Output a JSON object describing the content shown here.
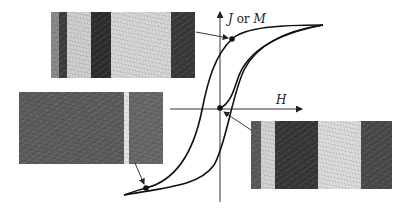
{
  "figure": {
    "axes": {
      "y_label_var1": "J",
      "y_label_or": "or",
      "y_label_var2": "M",
      "x_label": "H"
    },
    "colors": {
      "curve": "#111111",
      "axis": "#333333",
      "dark_domain": "#3a3a3a",
      "light_domain": "#d9d9d9"
    },
    "images": [
      {
        "id": "top-left-domains",
        "stripes": [
          {
            "x": 0,
            "w": 8,
            "shade": "#8a8a8a"
          },
          {
            "x": 8,
            "w": 8,
            "shade": "#3e3e3e"
          },
          {
            "x": 16,
            "w": 24,
            "shade": "#cfcfcf"
          },
          {
            "x": 40,
            "w": 20,
            "shade": "#2e2e2e"
          },
          {
            "x": 60,
            "w": 60,
            "shade": "#d6d6d6"
          },
          {
            "x": 120,
            "w": 24,
            "shade": "#3a3a3a"
          }
        ]
      },
      {
        "id": "left-domains",
        "stripes": [
          {
            "x": 0,
            "w": 105,
            "shade": "#5c5c5c"
          },
          {
            "x": 105,
            "w": 5,
            "shade": "#e6e6e6"
          },
          {
            "x": 110,
            "w": 34,
            "shade": "#686868"
          }
        ]
      },
      {
        "id": "right-domains",
        "stripes": [
          {
            "x": 0,
            "w": 10,
            "shade": "#5a5a5a"
          },
          {
            "x": 10,
            "w": 14,
            "shade": "#d3d3d3"
          },
          {
            "x": 24,
            "w": 43,
            "shade": "#383838"
          },
          {
            "x": 67,
            "w": 43,
            "shade": "#dcdcdc"
          },
          {
            "x": 110,
            "w": 31,
            "shade": "#4a4a4a"
          }
        ]
      }
    ]
  }
}
